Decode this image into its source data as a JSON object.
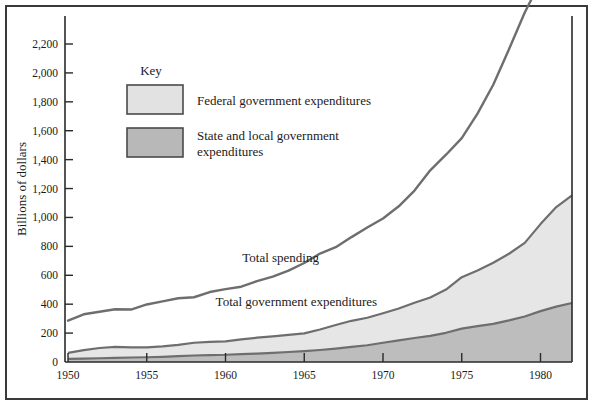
{
  "chart_data": {
    "type": "area",
    "title": "",
    "xlabel": "",
    "ylabel": "Billions of dollars",
    "xlim": [
      1950,
      1982
    ],
    "ylim": [
      0,
      2400
    ],
    "grid": false,
    "legend_position": "upper-left-inside",
    "legend_title": "Key",
    "x": [
      1950,
      1951,
      1952,
      1953,
      1954,
      1955,
      1956,
      1957,
      1958,
      1959,
      1960,
      1961,
      1962,
      1963,
      1964,
      1965,
      1966,
      1967,
      1968,
      1969,
      1970,
      1971,
      1972,
      1973,
      1974,
      1975,
      1976,
      1977,
      1978,
      1979,
      1980,
      1981,
      1982
    ],
    "xticks": [
      1950,
      1955,
      1960,
      1965,
      1970,
      1975,
      1980
    ],
    "xtick_labels": [
      "1950",
      "1955",
      "1960",
      "1965",
      "1970",
      "1975",
      "1980"
    ],
    "yticks": [
      0,
      200,
      400,
      600,
      800,
      1000,
      1200,
      1400,
      1600,
      1800,
      2000,
      2200
    ],
    "ytick_labels": [
      "0",
      "200",
      "400",
      "600",
      "800",
      "1,000",
      "1,200",
      "1,400",
      "1,600",
      "1,800",
      "2,000",
      "2,200"
    ],
    "series": [
      {
        "name": "Total spending",
        "kind": "line",
        "color": "#6e6e6e",
        "annotation": "Total spending",
        "values": [
          286,
          330,
          348,
          365,
          363,
          398,
          419,
          441,
          448,
          484,
          504,
          521,
          560,
          591,
          632,
          685,
          750,
          794,
          864,
          930,
          993,
          1077,
          1186,
          1326,
          1434,
          1549,
          1718,
          1918,
          2164,
          2418,
          2633,
          2860,
          3050
        ]
      },
      {
        "name": "Federal government expenditures",
        "kind": "area-stacked-top",
        "color": "#e2e2e2",
        "annotation": "Total government expenditures",
        "values": [
          41,
          58,
          71,
          77,
          70,
          68,
          72,
          79,
          88,
          91,
          93,
          101,
          110,
          114,
          118,
          123,
          142,
          163,
          181,
          190,
          204,
          220,
          244,
          265,
          299,
          356,
          385,
          423,
          461,
          509,
          602,
          689,
          745
        ]
      },
      {
        "name": "State and local government expenditures",
        "kind": "area-stacked-bottom",
        "color": "#b8b8b8",
        "values": [
          22,
          24,
          26,
          28,
          31,
          33,
          36,
          40,
          45,
          48,
          50,
          55,
          58,
          63,
          69,
          75,
          83,
          93,
          104,
          116,
          133,
          150,
          166,
          181,
          202,
          231,
          248,
          264,
          288,
          315,
          352,
          383,
          408
        ]
      }
    ],
    "annotations": [
      {
        "text": "Total spending",
        "x": 1963.5,
        "y": 690
      },
      {
        "text": "Total government expenditures",
        "x": 1964.5,
        "y": 385
      }
    ],
    "legend_items": [
      {
        "label": "Federal government expenditures",
        "color": "#e2e2e2"
      },
      {
        "label": "State and local government expenditures",
        "color": "#b8b8b8"
      }
    ],
    "colors": {
      "line": "#6e6e6e",
      "federal_fill": "#e6e6e6",
      "state_local_fill": "#bdbdbd",
      "axis": "#2a2a2a",
      "frame": "#3a3a3a",
      "background": "#ffffff",
      "text": "#1a1a1a"
    }
  }
}
